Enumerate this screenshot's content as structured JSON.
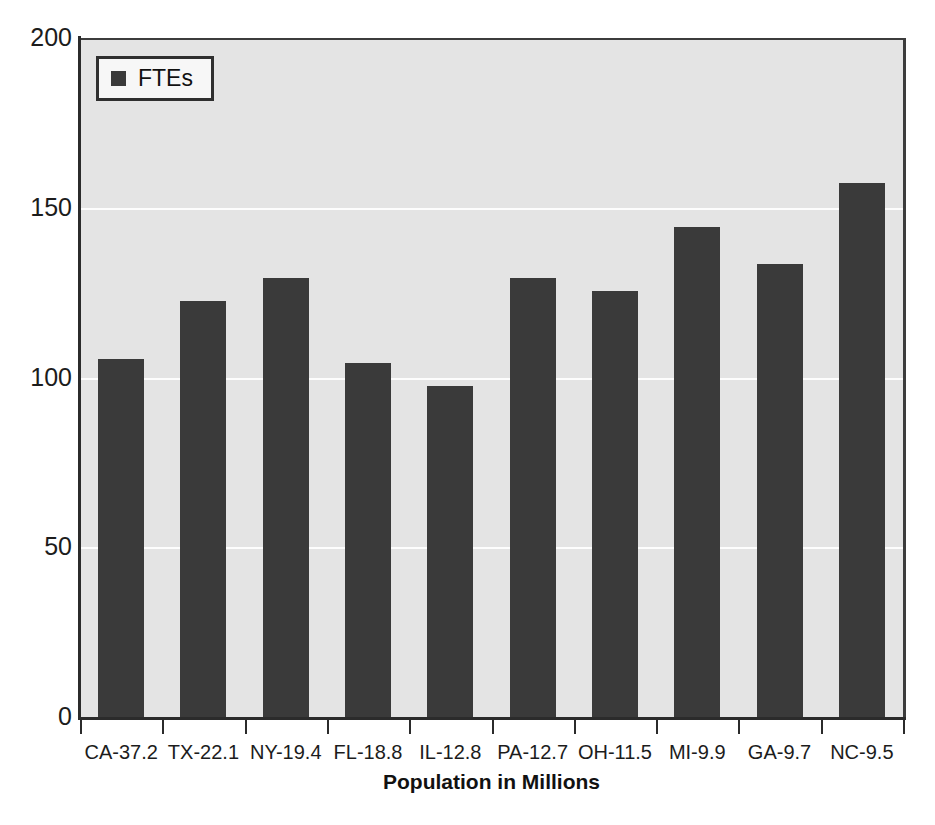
{
  "chart_data": {
    "type": "bar",
    "title": "",
    "subtitle": "",
    "xlabel": "Population in Millions",
    "ylabel": "",
    "categories": [
      "CA-37.2",
      "TX-22.1",
      "NY-19.4",
      "FL-18.8",
      "IL-12.8",
      "PA-12.7",
      "OH-11.5",
      "MI-9.9",
      "GA-9.7",
      "NC-9.5"
    ],
    "values": [
      106,
      123,
      130,
      105,
      98,
      130,
      126,
      145,
      134,
      158
    ],
    "series": [
      {
        "name": "FTEs",
        "values": [
          106,
          123,
          130,
          105,
          98,
          130,
          126,
          145,
          134,
          158
        ]
      }
    ],
    "ylim": [
      0,
      200
    ],
    "yticks": [
      0,
      50,
      100,
      150,
      200
    ],
    "ytick_labels": [
      "0",
      "50",
      "100",
      "150",
      "200"
    ],
    "grid": true,
    "gridline_values": [
      50,
      100,
      150
    ],
    "legend": {
      "position": "top-left",
      "entries": [
        {
          "label": "FTEs",
          "color": "#3a3a3a",
          "marker": "square"
        }
      ]
    },
    "colors": {
      "bar": "#3a3a3a",
      "plot_background": "#e4e4e4",
      "gridline": "#fdfdfd",
      "axis": "#2b2b2b",
      "text": "#1c1c1c",
      "legend_background": "#f7f7f7",
      "legend_border": "#2f2f2f",
      "figure_background": "#ffffff"
    }
  },
  "legend": {
    "swatch_name": "legend-color-swatch",
    "label": "FTEs"
  },
  "axis": {
    "x_title": "Population in Millions"
  }
}
